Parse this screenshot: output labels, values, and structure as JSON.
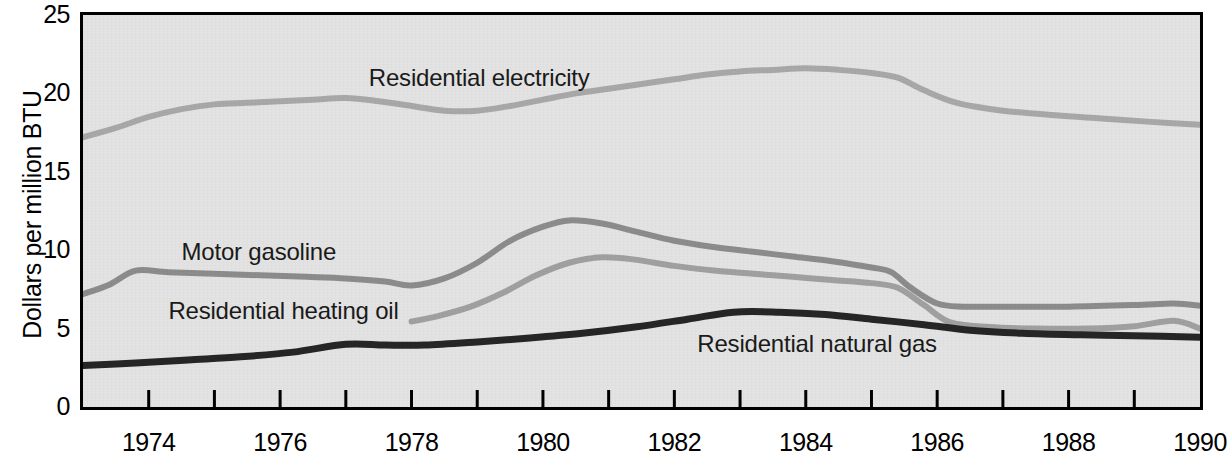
{
  "chart_data": {
    "type": "line",
    "title": "",
    "subtitle": "",
    "xlabel": "",
    "ylabel": "Dollars per million BTU",
    "xlim": [
      1973,
      1990
    ],
    "ylim": [
      0,
      25
    ],
    "grid": false,
    "legend_position": "inline-labels",
    "plot_background": "#e3e3e3",
    "x_tick_labels": [
      "1974",
      "1976",
      "1978",
      "1980",
      "1982",
      "1984",
      "1986",
      "1988",
      "1990"
    ],
    "x_tick_values": [
      1974,
      1976,
      1978,
      1980,
      1982,
      1984,
      1986,
      1988,
      1990
    ],
    "x_minor_ticks": [
      1973,
      1975,
      1977,
      1979,
      1981,
      1983,
      1985,
      1987,
      1989
    ],
    "y_tick_labels": [
      "0",
      "5",
      "10",
      "15",
      "20",
      "25"
    ],
    "y_tick_values": [
      0,
      5,
      10,
      15,
      20,
      25
    ],
    "series": [
      {
        "name": "Residential electricity",
        "color": "#a8a8a8",
        "label_x": 1977.35,
        "label_y": 21.0,
        "x": [
          1973.0,
          1973.5,
          1974.0,
          1974.5,
          1975.0,
          1975.5,
          1976.0,
          1976.5,
          1977.0,
          1977.5,
          1978.0,
          1978.5,
          1979.0,
          1979.5,
          1980.0,
          1980.5,
          1981.0,
          1981.5,
          1982.0,
          1982.5,
          1983.0,
          1983.5,
          1984.0,
          1984.5,
          1985.0,
          1985.4,
          1985.8,
          1986.3,
          1987.0,
          1987.8,
          1988.5,
          1989.2,
          1990.0
        ],
        "y": [
          17.2,
          17.8,
          18.5,
          19.0,
          19.3,
          19.4,
          19.5,
          19.6,
          19.7,
          19.5,
          19.2,
          18.9,
          18.9,
          19.2,
          19.6,
          20.0,
          20.3,
          20.6,
          20.9,
          21.2,
          21.4,
          21.5,
          21.6,
          21.5,
          21.3,
          21.0,
          20.2,
          19.4,
          18.9,
          18.6,
          18.4,
          18.2,
          18.0
        ]
      },
      {
        "name": "Motor gasoline",
        "color": "#8c8c8c",
        "label_x": 1974.5,
        "label_y": 9.9,
        "x": [
          1973.0,
          1973.4,
          1973.8,
          1974.3,
          1975.0,
          1975.7,
          1976.4,
          1977.0,
          1977.6,
          1978.0,
          1978.5,
          1979.0,
          1979.5,
          1980.0,
          1980.4,
          1980.9,
          1981.4,
          1982.0,
          1982.6,
          1983.2,
          1983.8,
          1984.4,
          1985.0,
          1985.3,
          1985.6,
          1986.0,
          1986.4,
          1987.0,
          1988.0,
          1989.0,
          1989.6,
          1990.0
        ],
        "y": [
          7.2,
          7.8,
          8.7,
          8.6,
          8.5,
          8.4,
          8.3,
          8.2,
          8.0,
          7.75,
          8.2,
          9.2,
          10.6,
          11.5,
          11.9,
          11.7,
          11.2,
          10.6,
          10.2,
          9.9,
          9.6,
          9.3,
          8.9,
          8.6,
          7.6,
          6.6,
          6.4,
          6.4,
          6.4,
          6.5,
          6.6,
          6.45
        ]
      },
      {
        "name": "Residential heating oil",
        "color": "#a0a0a0",
        "label_x": 1974.3,
        "label_y": 6.15,
        "x": [
          1978.0,
          1978.4,
          1978.9,
          1979.4,
          1979.9,
          1980.4,
          1980.9,
          1981.4,
          1982.0,
          1982.6,
          1983.2,
          1983.8,
          1984.4,
          1985.0,
          1985.4,
          1985.8,
          1986.2,
          1986.8,
          1987.5,
          1988.3,
          1989.0,
          1989.6,
          1990.0
        ],
        "y": [
          5.45,
          5.8,
          6.4,
          7.3,
          8.4,
          9.2,
          9.55,
          9.4,
          9.0,
          8.7,
          8.5,
          8.3,
          8.1,
          7.9,
          7.6,
          6.5,
          5.4,
          5.1,
          5.0,
          5.0,
          5.15,
          5.5,
          5.0
        ]
      },
      {
        "name": "Residential natural gas",
        "color": "#262626",
        "label_x": 1982.35,
        "label_y": 4.0,
        "x": [
          1973.0,
          1973.8,
          1974.6,
          1975.4,
          1976.2,
          1977.0,
          1977.6,
          1978.2,
          1979.0,
          1979.8,
          1980.6,
          1981.4,
          1982.2,
          1982.9,
          1983.6,
          1984.3,
          1985.0,
          1985.8,
          1986.5,
          1987.3,
          1988.2,
          1989.0,
          1990.0
        ],
        "y": [
          2.65,
          2.8,
          3.0,
          3.2,
          3.5,
          4.0,
          3.95,
          3.95,
          4.15,
          4.4,
          4.7,
          5.1,
          5.6,
          6.05,
          6.05,
          5.9,
          5.6,
          5.25,
          4.9,
          4.7,
          4.6,
          4.55,
          4.45
        ]
      }
    ]
  }
}
